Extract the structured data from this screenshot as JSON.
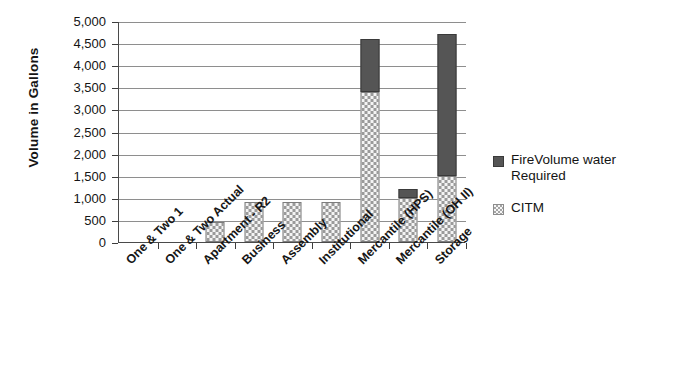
{
  "chart_data": {
    "type": "bar",
    "stacked": true,
    "title": "",
    "xlabel": "",
    "ylabel": "Volume in Gallons",
    "ylim": [
      0,
      5000
    ],
    "ytick_labels": [
      "5,000",
      "4,500",
      "4,000",
      "3,500",
      "3,000",
      "2,500",
      "2,000",
      "1,500",
      "1,000",
      "500",
      "0"
    ],
    "ytick_values": [
      5000,
      4500,
      4000,
      3500,
      3000,
      2500,
      2000,
      1500,
      1000,
      500,
      0
    ],
    "grid": true,
    "legend_position": "right",
    "categories": [
      "One & Two 1",
      "One & Two Actual",
      "Apartment - R2",
      "Business",
      "Assembly",
      "Institutional",
      "Mercantile (HPS)",
      "Mercantile (OH II)",
      "Storage"
    ],
    "series": [
      {
        "name": "CITM",
        "color": "#f2f2f2",
        "pattern": "checkerboard",
        "values": [
          0,
          0,
          450,
          900,
          900,
          900,
          3400,
          1000,
          1500
        ]
      },
      {
        "name": "FireVolume water Required",
        "color": "#555555",
        "pattern": "solid",
        "values": [
          0,
          0,
          0,
          0,
          0,
          0,
          1200,
          200,
          3200
        ]
      }
    ],
    "totals": [
      0,
      0,
      450,
      900,
      900,
      900,
      4600,
      1200,
      4700
    ]
  },
  "legend": {
    "items": [
      {
        "label_line1": "FireVolume water",
        "label_line2": "Required",
        "swatch": "dark-solid-swatch"
      },
      {
        "label_line1": "CITM",
        "label_line2": "",
        "swatch": "light-checker-swatch"
      }
    ]
  }
}
